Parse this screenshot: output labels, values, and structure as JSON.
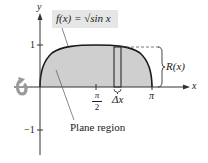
{
  "figure": {
    "function_label": "f(x) = √sin x",
    "function_prefix": "f(x) = ",
    "function_radicand": "sin x",
    "axis_labels": {
      "x": "x",
      "y": "y"
    },
    "y_ticks": [
      {
        "label": "1",
        "value": 1
      },
      {
        "label": "−1",
        "value": -1
      }
    ],
    "x_ticks": [
      {
        "label_num": "π",
        "label_den": "2",
        "value": "pi/2"
      },
      {
        "label": "π",
        "value": "pi"
      }
    ],
    "strip_label": "Δx",
    "radius_label": "R(x)",
    "region_label": "Plane region",
    "rotation_icon": "rotation-arrow-icon",
    "colors": {
      "region_fill": "#cfcfcf",
      "curve": "#1a1a1a",
      "axis": "#333333",
      "label_box": "#e6e6e6",
      "rotation_arrow": "#9a9a9a"
    }
  }
}
